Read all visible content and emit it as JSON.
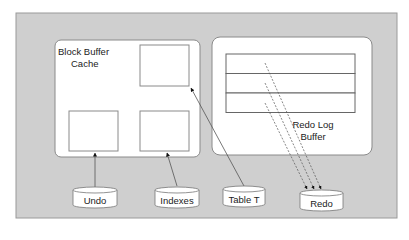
{
  "diagram": {
    "colors": {
      "background": "#ffffff",
      "frame_fill": "#cfcfcf",
      "frame_stroke": "#9a9a9a",
      "box_fill": "#ffffff",
      "line": "#555555"
    },
    "block_buffer_cache": {
      "label_line1": "Block Buffer",
      "label_line2": "Cache",
      "blocks": 3
    },
    "redo_log_buffer": {
      "label_line1": "Redo Log",
      "label_line2": "Buffer",
      "rows": 3
    },
    "datafiles": [
      {
        "label": "Undo"
      },
      {
        "label": "Indexes"
      },
      {
        "label": "Table T"
      },
      {
        "label": "Redo"
      }
    ]
  }
}
